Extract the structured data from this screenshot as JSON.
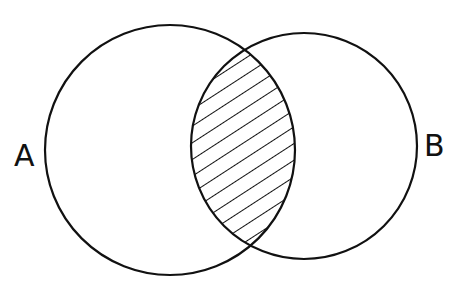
{
  "diagram": {
    "type": "venn",
    "sets": [
      {
        "label": "A",
        "cx": 170,
        "cy": 150,
        "r": 125
      },
      {
        "label": "B",
        "cx": 304,
        "cy": 146,
        "r": 113
      }
    ],
    "shaded_region": "intersection",
    "shading": "diagonal-hatch",
    "stroke_color": "#111111",
    "background": "#ffffff"
  }
}
